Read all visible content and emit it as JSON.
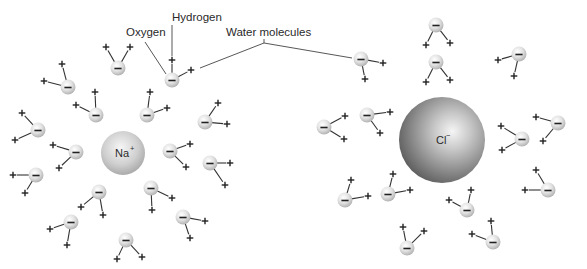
{
  "diagram": {
    "labels": {
      "hydrogen": "Hydrogen",
      "oxygen": "Oxygen",
      "water_molecules": "Water molecules"
    },
    "ions": [
      {
        "id": "sodium",
        "symbol": "Na",
        "charge": "+",
        "cx": 123,
        "cy": 153,
        "r": 22,
        "color_light": "#f4f4f4",
        "color_dark": "#a9a9a9"
      },
      {
        "id": "chloride",
        "symbol": "Cl",
        "charge": "−",
        "cx": 442,
        "cy": 140,
        "r": 43,
        "color_light": "#f2f2f2",
        "color_dark": "#5e5e5e"
      }
    ],
    "water_charges": {
      "oxygen": "−",
      "hydrogen": "+"
    },
    "colors": {
      "background": "#ffffff",
      "oxygen_sphere_light": "#ffffff",
      "oxygen_sphere_dark": "#bdbdbd",
      "line": "#333333"
    },
    "molecules_around_sodium": [
      {
        "o": [
          172,
          80
        ],
        "h1": [
          172,
          60
        ],
        "h2": [
          191,
          70
        ]
      },
      {
        "o": [
          118,
          68
        ],
        "h1": [
          106,
          47
        ],
        "h2": [
          130,
          47
        ]
      },
      {
        "o": [
          68,
          87
        ],
        "h1": [
          62,
          64
        ],
        "h2": [
          44,
          81
        ]
      },
      {
        "o": [
          96,
          115
        ],
        "h1": [
          95,
          92
        ],
        "h2": [
          76,
          105
        ]
      },
      {
        "o": [
          147,
          115
        ],
        "h1": [
          150,
          92
        ],
        "h2": [
          167,
          108
        ]
      },
      {
        "o": [
          205,
          122
        ],
        "h1": [
          218,
          103
        ],
        "h2": [
          227,
          124
        ]
      },
      {
        "o": [
          38,
          130
        ],
        "h1": [
          22,
          113
        ],
        "h2": [
          15,
          140
        ]
      },
      {
        "o": [
          76,
          152
        ],
        "h1": [
          53,
          145
        ],
        "h2": [
          59,
          168
        ]
      },
      {
        "o": [
          36,
          175
        ],
        "h1": [
          13,
          175
        ],
        "h2": [
          25,
          193
        ]
      },
      {
        "o": [
          170,
          151
        ],
        "h1": [
          190,
          144
        ],
        "h2": [
          186,
          167
        ]
      },
      {
        "o": [
          210,
          163
        ],
        "h1": [
          230,
          163
        ],
        "h2": [
          225,
          185
        ]
      },
      {
        "o": [
          99,
          192
        ],
        "h1": [
          81,
          207
        ],
        "h2": [
          103,
          215
        ]
      },
      {
        "o": [
          151,
          188
        ],
        "h1": [
          172,
          198
        ],
        "h2": [
          152,
          210
        ]
      },
      {
        "o": [
          71,
          222
        ],
        "h1": [
          50,
          229
        ],
        "h2": [
          67,
          245
        ]
      },
      {
        "o": [
          183,
          217
        ],
        "h1": [
          205,
          221
        ],
        "h2": [
          190,
          238
        ]
      },
      {
        "o": [
          126,
          240
        ],
        "h1": [
          117,
          259
        ],
        "h2": [
          142,
          257
        ]
      }
    ],
    "molecules_around_chloride": [
      {
        "o": [
          361,
          59
        ],
        "h1": [
          383,
          63
        ],
        "h2": [
          365,
          79
        ]
      },
      {
        "o": [
          436,
          25
        ],
        "h1": [
          426,
          45
        ],
        "h2": [
          450,
          43
        ]
      },
      {
        "o": [
          436,
          62
        ],
        "h1": [
          426,
          82
        ],
        "h2": [
          450,
          80
        ]
      },
      {
        "o": [
          519,
          54
        ],
        "h1": [
          498,
          60
        ],
        "h2": [
          514,
          76
        ]
      },
      {
        "o": [
          324,
          127
        ],
        "h1": [
          345,
          116
        ],
        "h2": [
          344,
          139
        ]
      },
      {
        "o": [
          367,
          115
        ],
        "h1": [
          390,
          112
        ],
        "h2": [
          380,
          133
        ]
      },
      {
        "o": [
          522,
          139
        ],
        "h1": [
          501,
          126
        ],
        "h2": [
          502,
          150
        ]
      },
      {
        "o": [
          558,
          123
        ],
        "h1": [
          536,
          117
        ],
        "h2": [
          543,
          141
        ]
      },
      {
        "o": [
          345,
          200
        ],
        "h1": [
          351,
          180
        ],
        "h2": [
          368,
          196
        ]
      },
      {
        "o": [
          388,
          194
        ],
        "h1": [
          393,
          174
        ],
        "h2": [
          410,
          190
        ]
      },
      {
        "o": [
          467,
          210
        ],
        "h1": [
          471,
          190
        ],
        "h2": [
          449,
          200
        ]
      },
      {
        "o": [
          548,
          190
        ],
        "h1": [
          536,
          170
        ],
        "h2": [
          525,
          190
        ]
      },
      {
        "o": [
          407,
          248
        ],
        "h1": [
          403,
          227
        ],
        "h2": [
          424,
          231
        ]
      },
      {
        "o": [
          493,
          242
        ],
        "h1": [
          491,
          221
        ],
        "h2": [
          472,
          234
        ]
      }
    ],
    "leaders": {
      "hydrogen": {
        "text_x": 176,
        "text_y": 21,
        "points": [
          [
            172,
            25
          ],
          [
            172,
            56
          ]
        ]
      },
      "oxygen": {
        "text_x": 126,
        "text_y": 36,
        "points": [
          [
            145,
            42
          ],
          [
            166,
            74
          ]
        ]
      },
      "water_molecules": {
        "text_x": 226,
        "text_y": 36,
        "apex": [
          264,
          43
        ],
        "to": [
          [
            200,
            68
          ],
          [
            352,
            58
          ]
        ]
      }
    }
  }
}
